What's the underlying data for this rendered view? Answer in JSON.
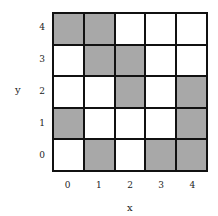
{
  "chart_data": {
    "type": "heatmap",
    "title": "",
    "xlabel": "x",
    "ylabel": "y",
    "x_ticks": [
      "0",
      "1",
      "2",
      "3",
      "4"
    ],
    "y_ticks": [
      "0",
      "1",
      "2",
      "3",
      "4"
    ],
    "grid": true,
    "legend": "none",
    "colors": {
      "filled": "#a8a8a8",
      "empty": "#ffffff",
      "border": "#111111"
    },
    "rows_top_to_bottom": [
      {
        "y": 4,
        "values": [
          1,
          1,
          0,
          0,
          0
        ]
      },
      {
        "y": 3,
        "values": [
          0,
          1,
          1,
          0,
          0
        ]
      },
      {
        "y": 2,
        "values": [
          0,
          0,
          1,
          0,
          1
        ]
      },
      {
        "y": 1,
        "values": [
          1,
          0,
          0,
          0,
          1
        ]
      },
      {
        "y": 0,
        "values": [
          0,
          1,
          0,
          1,
          1
        ]
      }
    ]
  }
}
